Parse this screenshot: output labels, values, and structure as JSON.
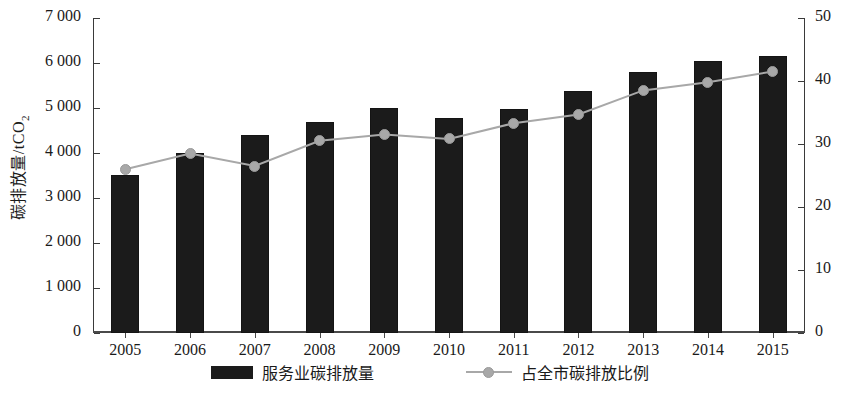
{
  "chart_data": {
    "type": "bar",
    "title": "",
    "subtitle": "",
    "categories": [
      "2005",
      "2006",
      "2007",
      "2008",
      "2009",
      "2010",
      "2011",
      "2012",
      "2013",
      "2014",
      "2015"
    ],
    "xlabel": "",
    "grid": false,
    "legend_position": "bottom-center",
    "series": [
      {
        "name": "服务业碳排放量",
        "type": "bar",
        "axis": "left",
        "color": "#1b1b1b",
        "values": [
          3520,
          4000,
          4400,
          4680,
          5000,
          4770,
          4970,
          5380,
          5800,
          6050,
          6150
        ]
      },
      {
        "name": "占全市碳排放比例",
        "type": "line",
        "axis": "right",
        "color": "#a8a8a8",
        "values": [
          26.0,
          28.5,
          26.5,
          30.5,
          31.5,
          30.8,
          33.3,
          34.7,
          38.5,
          39.8,
          41.5
        ]
      }
    ],
    "axes": {
      "left": {
        "label": "碳排放量/tCO",
        "label_subscript": "2",
        "ylim": [
          0,
          7000
        ],
        "ticks": [
          "7 000",
          "6 000",
          "5 000",
          "4 000",
          "3 000",
          "2 000",
          "1 000",
          "0"
        ],
        "tick_values": [
          7000,
          6000,
          5000,
          4000,
          3000,
          2000,
          1000,
          0
        ]
      },
      "right": {
        "label": "比例/%",
        "ylim": [
          0,
          50
        ],
        "ticks": [
          "50",
          "40",
          "30",
          "20",
          "10",
          "0"
        ],
        "tick_values": [
          50,
          40,
          30,
          20,
          10,
          0
        ]
      }
    }
  },
  "legend": {
    "items": [
      {
        "label": "服务业碳排放量",
        "marker": "bar-swatch"
      },
      {
        "label": "占全市碳排放比例",
        "marker": "line-dot-swatch"
      }
    ]
  }
}
